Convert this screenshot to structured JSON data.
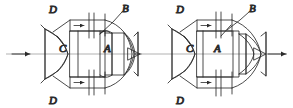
{
  "document": {
    "kind": "technical-line-drawing",
    "description": "Two cross-sectional schematic views of an axisymmetric flow duct / nozzle assembly shown in two operating configurations",
    "background_color": "#ffffff",
    "line_color": "#2b2b2b",
    "axis_color": "#9a9a9a",
    "label_color": "#1a1a1a"
  },
  "figures": [
    {
      "id": "figure-left",
      "name": "left-configuration-view",
      "labels": {
        "duct_top": "D",
        "duct_bottom": "D",
        "component_b": "B",
        "passage_c": "C",
        "body_a": "A"
      },
      "flow": {
        "inlet_arrow": "arrow-right",
        "duct_top_arrow": "arrow-right",
        "duct_bottom_arrow": "arrow-right",
        "outlet_arrow": "none"
      },
      "valves": {
        "top": "open",
        "bottom": "open"
      }
    },
    {
      "id": "figure-right",
      "name": "right-configuration-view",
      "labels": {
        "duct_top": "D",
        "duct_bottom": "D",
        "component_b": "B",
        "passage_c": "C",
        "body_a": "A"
      },
      "flow": {
        "inlet_arrow": "none",
        "duct_top_arrow": "arrow-right",
        "duct_bottom_arrow": "arrow-right",
        "outlet_arrow": "arrow-right"
      },
      "valves": {
        "top": "closed",
        "bottom": "closed"
      }
    }
  ],
  "centerline": {
    "name": "axis-of-symmetry",
    "style": "thin-grey-horizontal"
  }
}
